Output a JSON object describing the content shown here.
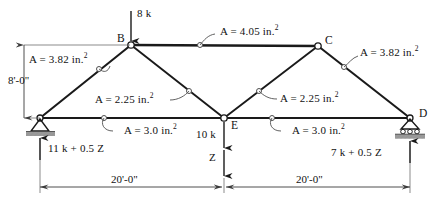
{
  "figure": {
    "type": "truss-free-body-diagram",
    "colors": {
      "member": "#1a1a1a",
      "thin_line": "#4a4a4a",
      "support_hatch": "#9a9a9a",
      "text": "#111111",
      "background": "#ffffff"
    }
  },
  "joints": [
    {
      "label": "",
      "name": "joint-a",
      "x": 40,
      "y": 118,
      "support": "pin"
    },
    {
      "label": "B",
      "name": "joint-b",
      "x": 131,
      "y": 45,
      "support": "none"
    },
    {
      "label": "C",
      "name": "joint-c",
      "x": 318,
      "y": 46,
      "support": "none"
    },
    {
      "label": "D",
      "name": "joint-d",
      "x": 410,
      "y": 118,
      "support": "roller"
    },
    {
      "label": "E",
      "name": "joint-e",
      "x": 224,
      "y": 118,
      "support": "none"
    }
  ],
  "members": [
    {
      "name": "member-ab",
      "area_label": "A = 3.82 in.",
      "exponent": "2",
      "from": "A",
      "to": "B"
    },
    {
      "name": "member-bc",
      "area_label": "A = 4.05 in.",
      "exponent": "2",
      "from": "B",
      "to": "C"
    },
    {
      "name": "member-cd",
      "area_label": "A = 3.82 in.",
      "exponent": "2",
      "from": "C",
      "to": "D"
    },
    {
      "name": "member-be",
      "area_label": "A = 2.25 in.",
      "exponent": "2",
      "from": "B",
      "to": "E"
    },
    {
      "name": "member-ce",
      "area_label": "A = 2.25 in.",
      "exponent": "2",
      "from": "C",
      "to": "E"
    },
    {
      "name": "member-ae",
      "area_label": "A = 3.0 in.",
      "exponent": "2",
      "from": "A",
      "to": "E"
    },
    {
      "name": "member-ed",
      "area_label": "A = 3.0 in.",
      "exponent": "2",
      "from": "E",
      "to": "D"
    }
  ],
  "area_labels": {
    "ab": "A = 3.82 in.",
    "bc": "A = 4.05 in.",
    "cd": "A = 3.82 in.",
    "be": "A = 2.25 in.",
    "ce": "A = 2.25 in.",
    "ae": "A = 3.0 in.",
    "ed": "A = 3.0 in.",
    "exp": "2"
  },
  "joint_labels": {
    "b": "B",
    "c": "C",
    "d": "D",
    "e": "E"
  },
  "loads": [
    {
      "name": "load-at-b",
      "label": "8 k",
      "at": "B",
      "direction": "down"
    },
    {
      "name": "load-at-e",
      "label": "10 k",
      "at": "E",
      "direction": "down"
    },
    {
      "name": "load-variable-z",
      "label": "Z",
      "at": "E",
      "direction": "down"
    }
  ],
  "load_labels": {
    "b": "8 k",
    "e": "10 k",
    "z": "Z"
  },
  "reactions": {
    "left": "11 k + 0.5 Z",
    "right": "7 k + 0.5 Z"
  },
  "dimensions": {
    "height": "8'-0\"",
    "span_left": "20'-0\"",
    "span_right": "20'-0\""
  }
}
